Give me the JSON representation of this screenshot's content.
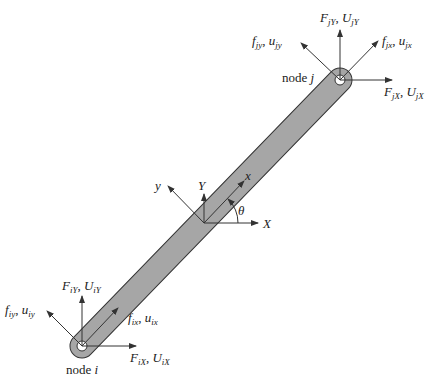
{
  "diagram": {
    "type": "truss element free-body diagram",
    "colors": {
      "bar_fill": "#a6a6a6",
      "stroke": "#333333",
      "arrow": "#333333",
      "background": "#ffffff"
    },
    "nodes": [
      {
        "id": "i",
        "label": "node",
        "name": "i"
      },
      {
        "id": "j",
        "label": "node",
        "name": "j"
      }
    ],
    "global_axes": {
      "x_label": "X",
      "y_label": "Y"
    },
    "local_axes": {
      "x_label": "x",
      "y_label": "y"
    },
    "angle_label": "θ",
    "node_j_labels": {
      "global_y": {
        "F": "F",
        "F_sub": "jY",
        "U": "U",
        "U_sub": "jY",
        "text": "F_jY, U_jY"
      },
      "global_x": {
        "F": "F",
        "F_sub": "jX",
        "U": "U",
        "U_sub": "jX",
        "text": "F_jX, U_jX"
      },
      "local_x": {
        "f": "f",
        "f_sub": "jx",
        "u": "u",
        "u_sub": "jx",
        "text": "f_jx, u_jx"
      },
      "local_y": {
        "f": "f",
        "f_sub": "jy",
        "u": "u",
        "u_sub": "jy",
        "text": "f_jy, u_jy"
      }
    },
    "node_i_labels": {
      "global_y": {
        "F": "F",
        "F_sub": "iY",
        "U": "U",
        "U_sub": "iY",
        "text": "F_iY, U_iY"
      },
      "global_x": {
        "F": "F",
        "F_sub": "iX",
        "U": "U",
        "U_sub": "iX",
        "text": "F_iX, U_iX"
      },
      "local_x": {
        "f": "f",
        "f_sub": "ix",
        "u": "u",
        "u_sub": "ix",
        "text": "f_ix, u_ix"
      },
      "local_y": {
        "f": "f",
        "f_sub": "iy",
        "u": "u",
        "u_sub": "iy",
        "text": "f_iy, u_iy"
      }
    },
    "separator": ", "
  }
}
